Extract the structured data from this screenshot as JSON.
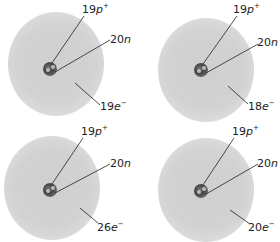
{
  "diagram": {
    "type": "atom-models",
    "panels": [
      {
        "id": "a",
        "protons": {
          "num": "19",
          "sym": "p",
          "charge": "+"
        },
        "neutrons": {
          "num": "20",
          "sym": "n"
        },
        "electrons": {
          "num": "19",
          "sym": "e",
          "charge": "−"
        }
      },
      {
        "id": "b",
        "protons": {
          "num": "19",
          "sym": "p",
          "charge": "+"
        },
        "neutrons": {
          "num": "20",
          "sym": "n"
        },
        "electrons": {
          "num": "18",
          "sym": "e",
          "charge": "−"
        }
      },
      {
        "id": "c",
        "protons": {
          "num": "19",
          "sym": "p",
          "charge": "+"
        },
        "neutrons": {
          "num": "20",
          "sym": "n"
        },
        "electrons": {
          "num": "26",
          "sym": "e",
          "charge": "−"
        }
      },
      {
        "id": "d",
        "protons": {
          "num": "19",
          "sym": "p",
          "charge": "+"
        },
        "neutrons": {
          "num": "20",
          "sym": "n"
        },
        "electrons": {
          "num": "20",
          "sym": "e",
          "charge": "−"
        }
      }
    ]
  }
}
